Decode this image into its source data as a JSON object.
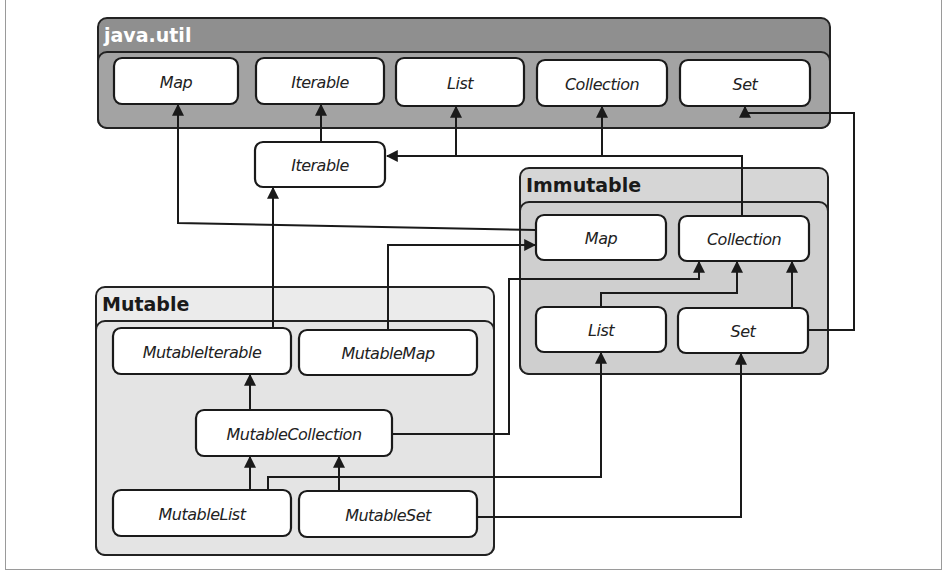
{
  "figure": {
    "type": "class-hierarchy-diagram",
    "groups": [
      {
        "id": "javautil",
        "title": "java.util",
        "outer_fill": "#8f8f8f",
        "inner_fill": "#a3a3a3",
        "title_color": "#ffffff"
      },
      {
        "id": "immutable",
        "title": "Immutable",
        "outer_fill": "#d6d6d6",
        "inner_fill": "#cfcfcf",
        "title_color": "#1a1a1a"
      },
      {
        "id": "mutable",
        "title": "Mutable",
        "outer_fill": "#ebebeb",
        "inner_fill": "#e4e4e4",
        "title_color": "#1a1a1a"
      }
    ],
    "nodes": [
      {
        "id": "ju-map",
        "label": "Map",
        "group": "javautil"
      },
      {
        "id": "ju-iterable",
        "label": "Iterable",
        "group": "javautil"
      },
      {
        "id": "ju-list",
        "label": "List",
        "group": "javautil"
      },
      {
        "id": "ju-collection",
        "label": "Collection",
        "group": "javautil"
      },
      {
        "id": "ju-set",
        "label": "Set",
        "group": "javautil"
      },
      {
        "id": "iterable",
        "label": "Iterable",
        "group": null
      },
      {
        "id": "im-map",
        "label": "Map",
        "group": "immutable"
      },
      {
        "id": "im-collection",
        "label": "Collection",
        "group": "immutable"
      },
      {
        "id": "im-list",
        "label": "List",
        "group": "immutable"
      },
      {
        "id": "im-set",
        "label": "Set",
        "group": "immutable"
      },
      {
        "id": "mutable-iterable",
        "label": "MutableIterable",
        "group": "mutable"
      },
      {
        "id": "mutable-map",
        "label": "MutableMap",
        "group": "mutable"
      },
      {
        "id": "mutable-collection",
        "label": "MutableCollection",
        "group": "mutable"
      },
      {
        "id": "mutable-list",
        "label": "MutableList",
        "group": "mutable"
      },
      {
        "id": "mutable-set",
        "label": "MutableSet",
        "group": "mutable"
      }
    ],
    "edges": [
      {
        "from": "iterable",
        "to": "ju-iterable"
      },
      {
        "from": "im-collection",
        "to": "iterable"
      },
      {
        "from": "im-collection",
        "to": "ju-collection"
      },
      {
        "from": "im-map",
        "to": "ju-map"
      },
      {
        "from": "im-list",
        "to": "ju-list"
      },
      {
        "from": "im-set",
        "to": "ju-set"
      },
      {
        "from": "im-list",
        "to": "im-collection"
      },
      {
        "from": "im-set",
        "to": "im-collection"
      },
      {
        "from": "mutable-iterable",
        "to": "iterable"
      },
      {
        "from": "mutable-map",
        "to": "im-map"
      },
      {
        "from": "mutable-collection",
        "to": "mutable-iterable"
      },
      {
        "from": "mutable-collection",
        "to": "im-collection"
      },
      {
        "from": "mutable-list",
        "to": "mutable-collection"
      },
      {
        "from": "mutable-list",
        "to": "im-list"
      },
      {
        "from": "mutable-set",
        "to": "mutable-collection"
      },
      {
        "from": "mutable-set",
        "to": "im-set"
      }
    ]
  }
}
